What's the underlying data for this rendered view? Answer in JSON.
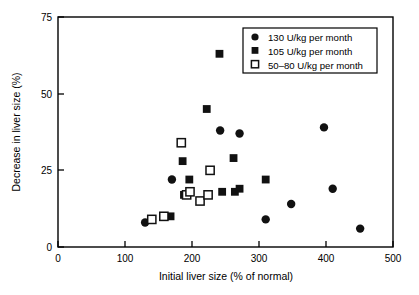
{
  "chart_data": {
    "type": "scatter",
    "title": "",
    "xlabel": "Initial liver size (% of normal)",
    "ylabel": "Decrease in liver size (%)",
    "xlim": [
      0,
      500
    ],
    "ylim": [
      0,
      75
    ],
    "xticks": [
      0,
      100,
      200,
      300,
      400,
      500
    ],
    "yticks": [
      0,
      25,
      50,
      75
    ],
    "xtick_labels": [
      "0",
      "100",
      "200",
      "300",
      "400",
      "500"
    ],
    "ytick_labels": [
      "0",
      "25",
      "50",
      "75"
    ],
    "grid": false,
    "legend_position": "top-right",
    "series": [
      {
        "name": "130 U/kg per month",
        "marker": "filled-circle",
        "color": "#111111",
        "points": [
          [
            130,
            8
          ],
          [
            170,
            22
          ],
          [
            242,
            38
          ],
          [
            271,
            37
          ],
          [
            310,
            9
          ],
          [
            348,
            14
          ],
          [
            397,
            39
          ],
          [
            410,
            19
          ],
          [
            451,
            6
          ]
        ]
      },
      {
        "name": "105 U/kg per month",
        "marker": "filled-square",
        "color": "#111111",
        "points": [
          [
            168,
            10
          ],
          [
            186,
            28
          ],
          [
            188,
            17
          ],
          [
            196,
            22
          ],
          [
            222,
            45
          ],
          [
            241,
            63
          ],
          [
            245,
            18
          ],
          [
            262,
            29
          ],
          [
            264,
            18
          ],
          [
            271,
            19
          ],
          [
            310,
            22
          ]
        ]
      },
      {
        "name": "50–80 U/kg per month",
        "marker": "open-square",
        "color": "#111111",
        "points": [
          [
            140,
            9
          ],
          [
            158,
            10
          ],
          [
            184,
            34
          ],
          [
            192,
            17
          ],
          [
            197,
            18
          ],
          [
            212,
            15
          ],
          [
            224,
            17
          ],
          [
            227,
            25
          ]
        ]
      }
    ]
  },
  "axes": {
    "x_title": "Initial liver size (% of normal)",
    "y_title": "Decrease in liver size (%)",
    "x_tick_labels": [
      "0",
      "100",
      "200",
      "300",
      "400",
      "500"
    ],
    "y_tick_labels": [
      "0",
      "25",
      "50",
      "75"
    ]
  },
  "legend": {
    "entries": [
      {
        "label": "130 U/kg per month",
        "marker": "filled-circle-icon"
      },
      {
        "label": "105 U/kg per month",
        "marker": "filled-square-icon"
      },
      {
        "label": "50–80 U/kg per month",
        "marker": "open-square-icon"
      }
    ]
  },
  "colors": {
    "marker": "#111111",
    "axis": "#000000",
    "background": "#ffffff"
  }
}
